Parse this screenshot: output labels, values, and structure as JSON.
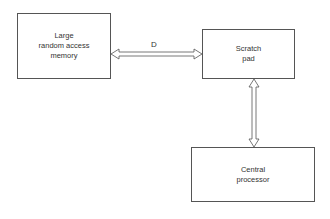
{
  "diagram": {
    "nodes": [
      {
        "id": "memory",
        "label": "Large\nrandom access\nmemory"
      },
      {
        "id": "scratchpad",
        "label": "Scratch\npad"
      },
      {
        "id": "cpu",
        "label": "Central\nprocessor"
      }
    ],
    "edges": [
      {
        "from": "memory",
        "to": "scratchpad",
        "label": "D",
        "direction": "bidirectional"
      },
      {
        "from": "scratchpad",
        "to": "cpu",
        "label": "",
        "direction": "bidirectional"
      }
    ]
  }
}
